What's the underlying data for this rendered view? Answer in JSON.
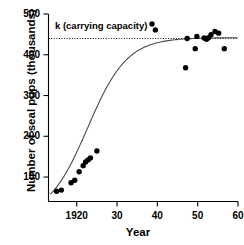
{
  "chart_data": {
    "type": "scatter",
    "title": "",
    "xlabel": "Year",
    "ylabel": "Number of seal pups (thousands)",
    "xlim": [
      1913,
      1960
    ],
    "ylim": [
      40,
      500
    ],
    "grid": false,
    "legend": null,
    "xticks": [
      {
        "value": 1920,
        "label": "1920"
      },
      {
        "value": 1930,
        "label": "30"
      },
      {
        "value": 1940,
        "label": "40"
      },
      {
        "value": 1950,
        "label": "50"
      },
      {
        "value": 1960,
        "label": "60"
      }
    ],
    "yticks": [
      {
        "value": 100,
        "label": "100"
      },
      {
        "value": 200,
        "label": "200"
      },
      {
        "value": 300,
        "label": "300"
      },
      {
        "value": 400,
        "label": "400"
      },
      {
        "value": 500,
        "label": "500"
      }
    ],
    "annotations": [
      {
        "name": "carrying-capacity",
        "text": "k (carrying capacity)",
        "value": 440
      }
    ],
    "series": [
      {
        "name": "Observed seal pup counts",
        "type": "scatter",
        "marker": "filled-circle",
        "color": "#000000",
        "points": [
          {
            "x": 1915.0,
            "y": 65
          },
          {
            "x": 1916.2,
            "y": 68
          },
          {
            "x": 1918.6,
            "y": 86
          },
          {
            "x": 1919.5,
            "y": 92
          },
          {
            "x": 1920.6,
            "y": 113
          },
          {
            "x": 1921.6,
            "y": 128
          },
          {
            "x": 1922.2,
            "y": 137
          },
          {
            "x": 1922.8,
            "y": 142
          },
          {
            "x": 1923.4,
            "y": 147
          },
          {
            "x": 1925.0,
            "y": 164
          },
          {
            "x": 1939.5,
            "y": 461
          },
          {
            "x": 1947.0,
            "y": 368
          },
          {
            "x": 1947.4,
            "y": 440
          },
          {
            "x": 1949.4,
            "y": 415
          },
          {
            "x": 1949.8,
            "y": 445
          },
          {
            "x": 1951.6,
            "y": 441
          },
          {
            "x": 1952.2,
            "y": 438
          },
          {
            "x": 1952.7,
            "y": 442
          },
          {
            "x": 1953.3,
            "y": 449
          },
          {
            "x": 1954.3,
            "y": 457
          },
          {
            "x": 1955.2,
            "y": 453
          },
          {
            "x": 1956.6,
            "y": 415
          }
        ]
      },
      {
        "name": "Logistic growth model",
        "type": "line",
        "color": "#555555",
        "model": "logistic",
        "K": 442,
        "N0": 58,
        "r": 0.205,
        "inflection_year": 1932.5
      }
    ]
  },
  "axes": {
    "y_title": "Number of seal pups (thousands)",
    "x_title": "Year"
  }
}
